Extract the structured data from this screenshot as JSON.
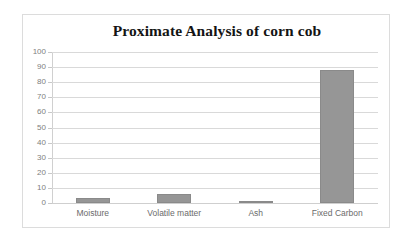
{
  "chart_data": {
    "type": "bar",
    "title": "Proximate Analysis of corn cob",
    "xlabel": "",
    "ylabel": "",
    "categories": [
      "Moisture",
      "Volatile matter",
      "Ash",
      "Fixed Carbon"
    ],
    "values": [
      3,
      6,
      1,
      88
    ],
    "series": [
      {
        "name": "Proximate Analysis",
        "values": [
          3,
          6,
          1,
          88
        ]
      }
    ],
    "ylim": [
      0,
      100
    ],
    "ytick_labels": [
      "100",
      "90",
      "80",
      "70",
      "60",
      "50",
      "40",
      "30",
      "20",
      "10",
      "0"
    ],
    "ytick_values": [
      100,
      90,
      80,
      70,
      60,
      50,
      40,
      30,
      20,
      10,
      0
    ],
    "ytick_step": 10,
    "grid": true,
    "grid_axis": "y",
    "legend": false,
    "legend_position": "none",
    "bar_color": "#969696",
    "grid_color": "#d9d9d9",
    "title_color": "#141414",
    "tick_label_color": "#808080",
    "category_label_color": "#6b6b6b",
    "plot_background": "#ffffff",
    "frame_border_color": "#dcdcdc"
  }
}
